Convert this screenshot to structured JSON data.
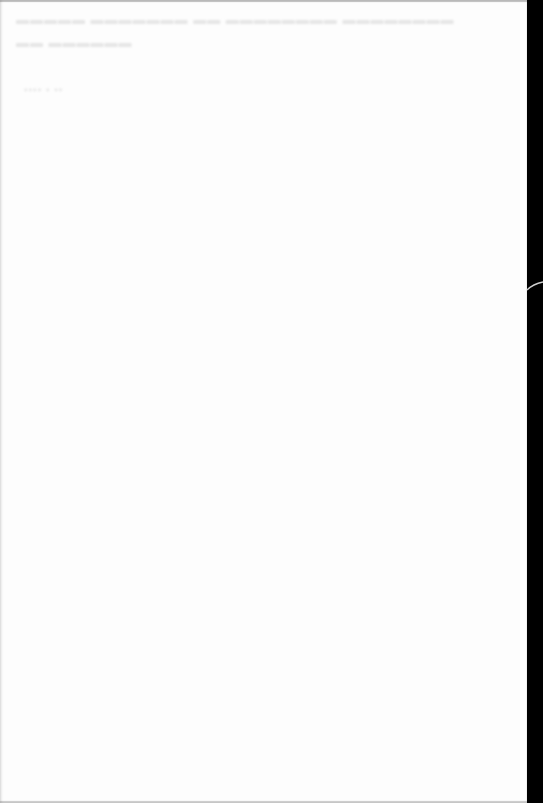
{
  "document": {
    "type": "blank paper sheet (scanned)",
    "background_color": "#fdfdfd",
    "border_color": "#000000",
    "show_through_text": {
      "line1": "▬▬▬▬▬ ▬▬▬▬▬▬▬ ▬▬ ▬▬▬▬▬▬▬▬ ▬▬▬▬▬▬▬▬",
      "line2": "▬▬ ▬▬▬▬▬▬",
      "line3": "▪▪▪▪ ▪ ▪▪"
    }
  }
}
